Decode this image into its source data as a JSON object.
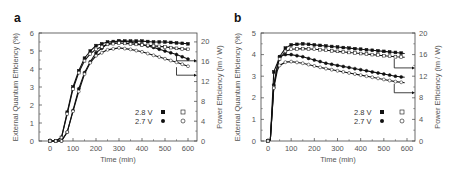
{
  "chart_data": [
    {
      "panel": "a",
      "type": "line",
      "title": "",
      "xlabel": "Time (min)",
      "ylabel": "External Quantum Efficiency (%)",
      "y2label": "Power Efficiency (lm / W)",
      "xlim": [
        -50,
        620
      ],
      "ylim": [
        0,
        6
      ],
      "y2lim": [
        0,
        22
      ],
      "xticks": [
        0,
        100,
        200,
        300,
        400,
        500,
        600
      ],
      "yticks": [
        0,
        1,
        2,
        3,
        4,
        5,
        6
      ],
      "y2ticks": [
        0,
        4,
        8,
        12,
        16,
        20
      ],
      "legend": {
        "rows": [
          "2.8 V",
          "2.7 V"
        ],
        "position": "lower right"
      },
      "x": [
        0,
        25,
        50,
        75,
        100,
        125,
        150,
        175,
        200,
        250,
        300,
        350,
        400,
        450,
        500,
        550,
        600
      ],
      "series": [
        {
          "name": "2.8 V EQE (filled square)",
          "axis": "left",
          "values": [
            0,
            0,
            0.2,
            1.6,
            3.0,
            3.9,
            4.6,
            5.0,
            5.3,
            5.5,
            5.55,
            5.55,
            5.55,
            5.5,
            5.5,
            5.45,
            5.4
          ]
        },
        {
          "name": "2.7 V EQE (filled circle)",
          "axis": "left",
          "values": [
            0,
            0,
            0,
            0.5,
            1.7,
            2.9,
            3.8,
            4.4,
            4.9,
            5.4,
            5.55,
            5.5,
            5.35,
            5.2,
            5.0,
            4.8,
            4.55
          ]
        },
        {
          "name": "2.8 V PE (open square)",
          "axis": "right",
          "values": [
            0,
            0,
            0.7,
            5.5,
            10.5,
            13.8,
            16.2,
            17.6,
            18.5,
            19.5,
            19.8,
            19.6,
            19.4,
            19.2,
            19.0,
            18.7,
            18.5
          ]
        },
        {
          "name": "2.7 V PE (open circle)",
          "axis": "right",
          "values": [
            0,
            0,
            0,
            1.8,
            6.0,
            10.0,
            13.5,
            15.8,
            17.2,
            18.4,
            18.8,
            18.5,
            18.0,
            17.3,
            16.6,
            15.9,
            15.1
          ]
        }
      ]
    },
    {
      "panel": "b",
      "type": "line",
      "title": "",
      "xlabel": "Time (min)",
      "ylabel": "External Quantum Efficiency (%)",
      "y2label": "Power Efficiency (lm / W)",
      "xlim": [
        -50,
        620
      ],
      "ylim": [
        0,
        5
      ],
      "y2lim": [
        0,
        20
      ],
      "xticks": [
        0,
        100,
        200,
        300,
        400,
        500,
        600
      ],
      "yticks": [
        0,
        1,
        2,
        3,
        4,
        5
      ],
      "y2ticks": [
        0,
        4,
        8,
        12,
        16,
        20
      ],
      "legend": {
        "rows": [
          "2.8 V",
          "2.7 V"
        ],
        "position": "lower right"
      },
      "x": [
        0,
        10,
        25,
        40,
        50,
        75,
        100,
        150,
        200,
        250,
        300,
        350,
        400,
        450,
        500,
        550,
        590
      ],
      "series": [
        {
          "name": "2.8 V EQE (filled square)",
          "axis": "left",
          "values": [
            0,
            0.05,
            3.2,
            3.6,
            3.9,
            4.3,
            4.45,
            4.5,
            4.45,
            4.4,
            4.35,
            4.3,
            4.25,
            4.2,
            4.15,
            4.1,
            4.05
          ]
        },
        {
          "name": "2.7 V EQE (filled circle)",
          "axis": "left",
          "values": [
            0,
            0.05,
            2.6,
            3.4,
            3.9,
            4.0,
            4.0,
            3.9,
            3.75,
            3.6,
            3.5,
            3.4,
            3.3,
            3.2,
            3.1,
            3.0,
            2.95
          ]
        },
        {
          "name": "2.8 V PE (open square)",
          "axis": "right",
          "values": [
            0,
            0.2,
            10.0,
            14.0,
            15.2,
            16.6,
            17.0,
            17.1,
            17.0,
            16.8,
            16.6,
            16.4,
            16.2,
            16.0,
            15.8,
            15.6,
            15.5
          ]
        },
        {
          "name": "2.7 V PE (open circle)",
          "axis": "right",
          "values": [
            0,
            0.2,
            9.8,
            13.0,
            14.0,
            14.6,
            14.7,
            14.4,
            13.9,
            13.4,
            13.0,
            12.6,
            12.2,
            11.8,
            11.4,
            11.0,
            10.8
          ]
        }
      ]
    }
  ],
  "panels": {
    "a": {
      "label": "a",
      "xlabel": "Time (min)",
      "ylabel": "External Quantum Efficiency (%)",
      "y2label": "Power Efficiency (lm / W)",
      "legend_28": "2.8 V",
      "legend_27": "2.7 V"
    },
    "b": {
      "label": "b",
      "xlabel": "Time (min)",
      "ylabel": "External Quantum Efficiency (%)",
      "y2label": "Power Efficiency (lm / W)",
      "legend_28": "2.8 V",
      "legend_27": "2.7 V"
    }
  }
}
